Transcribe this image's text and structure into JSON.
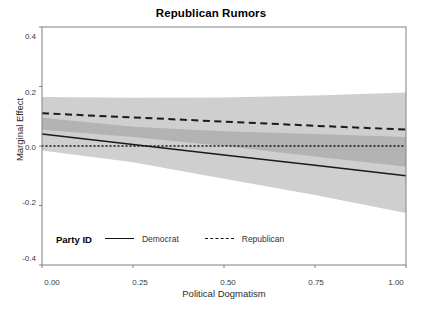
{
  "chart_data": {
    "type": "line",
    "title": "Republican Rumors",
    "xlabel": "Political Dogmatism",
    "ylabel": "Marginal Effect",
    "xlim": [
      0.0,
      1.0
    ],
    "ylim": [
      -0.4,
      0.4
    ],
    "grid": false,
    "zero_reference_line": {
      "y": 0.0,
      "style": "dotted"
    },
    "xticks": [
      "0.00",
      "0.25",
      "0.50",
      "0.75",
      "1.00"
    ],
    "xtick_values": [
      0.0,
      0.25,
      0.5,
      0.75,
      1.0
    ],
    "yticks": [
      "0.4",
      "0.2",
      "0.0",
      "-0.2",
      "-0.4"
    ],
    "ytick_values": [
      0.4,
      0.2,
      0.0,
      -0.2,
      -0.4
    ],
    "legend": {
      "title": "Party ID",
      "position": "bottom-left-inside",
      "entries": [
        {
          "name": "Democrat",
          "style": "solid"
        },
        {
          "name": "Republican",
          "style": "dashed"
        }
      ]
    },
    "x": [
      0.0,
      0.25,
      0.5,
      0.75,
      1.0
    ],
    "series": [
      {
        "name": "Democrat",
        "style": "solid",
        "color": "#1a1a1a",
        "values": [
          0.04,
          0.005,
          -0.03,
          -0.065,
          -0.1
        ],
        "ci_lower": [
          -0.015,
          -0.055,
          -0.11,
          -0.165,
          -0.225
        ],
        "ci_upper": [
          0.095,
          0.065,
          0.05,
          0.04,
          0.03
        ],
        "band_color": "#cfcfcf"
      },
      {
        "name": "Republican",
        "style": "dashed",
        "color": "#1a1a1a",
        "values": [
          0.11,
          0.096,
          0.082,
          0.068,
          0.055
        ],
        "ci_lower": [
          0.055,
          0.03,
          0.0,
          -0.035,
          -0.07
        ],
        "ci_upper": [
          0.165,
          0.162,
          0.163,
          0.17,
          0.18
        ],
        "band_color": "#cfcfcf"
      }
    ]
  },
  "figure": {
    "title": "Republican Rumors",
    "x_axis_title": "Political Dogmatism",
    "y_axis_title": "Marginal Effect",
    "xticks": [
      "0.00",
      "0.25",
      "0.50",
      "0.75",
      "1.00"
    ],
    "yticks": [
      "0.4",
      "0.2",
      "0.0",
      "-0.2",
      "-0.4"
    ],
    "legend_title": "Party ID",
    "legend_democrat": "Democrat",
    "legend_republican": "Republican",
    "panel_border_color": "#808080",
    "band_color": "#cfcfcf",
    "band_overlap_color": "#b3b3b3",
    "line_color": "#1a1a1a"
  }
}
